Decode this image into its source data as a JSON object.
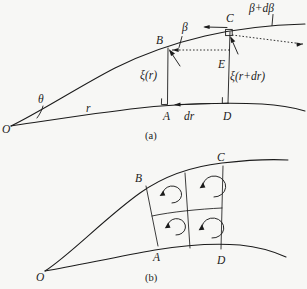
{
  "figure": {
    "background_color": "#f7f7f5",
    "ink_color": "#1b1b1b",
    "width": 307,
    "height": 289
  },
  "panel_a": {
    "caption": "(a)",
    "points": {
      "origin": "O",
      "b": "B",
      "c": "C",
      "e": "E",
      "a": "A",
      "d": "D"
    },
    "labels": {
      "theta": "θ",
      "r": "r",
      "dr": "dr",
      "beta": "β",
      "beta_plus_dbeta": "β+dβ",
      "xi_r": "ξ(r)",
      "xi_r_plus_dr": "ξ(r+dr)"
    }
  },
  "panel_b": {
    "caption": "(b)",
    "points": {
      "origin": "O",
      "b": "B",
      "c": "C",
      "a": "A",
      "d": "D"
    },
    "cell_count": 4,
    "cell_symbol": "circulation-arrow"
  }
}
